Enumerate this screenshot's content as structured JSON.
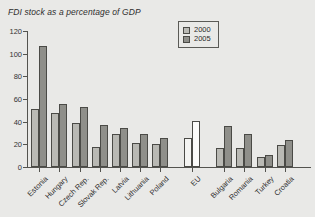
{
  "chart_data": {
    "type": "bar",
    "title": "FDI stock as a percentage of GDP",
    "xlabel": "",
    "ylabel": "",
    "ylim": [
      0,
      120
    ],
    "yticks": [
      0,
      20,
      40,
      60,
      80,
      100,
      120
    ],
    "grid": false,
    "legend_position": "top-right",
    "categories": [
      "Estonia",
      "Hungary",
      "Czech Rep.",
      "Slovak Rep.",
      "Latvia",
      "Lithuania",
      "Poland",
      "EU",
      "Bulgaria",
      "Romania",
      "Turkey",
      "Croatia"
    ],
    "series": [
      {
        "name": "2000",
        "color": "#b9b9b4",
        "values": [
          51,
          48,
          39,
          18,
          29,
          21,
          20,
          26,
          17,
          17,
          9,
          19
        ]
      },
      {
        "name": "2005",
        "color": "#8f8f8a",
        "values": [
          107,
          56,
          53,
          37,
          34,
          29,
          26,
          41,
          36,
          29,
          11,
          24
        ]
      }
    ],
    "highlighted_category": "EU"
  },
  "legend": {
    "entries": [
      {
        "label": "2000",
        "swatch": "swatch-2000"
      },
      {
        "label": "2005",
        "swatch": "swatch-2005"
      }
    ]
  }
}
